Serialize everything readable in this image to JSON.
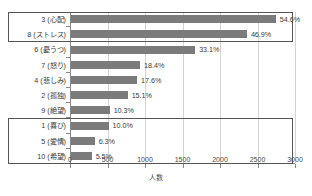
{
  "chart_data": {
    "type": "bar",
    "orientation": "horizontal",
    "title": "",
    "xlabel": "人数",
    "ylabel": "",
    "xlim": [
      0,
      3000
    ],
    "xticks": [
      "0",
      "500",
      "1000",
      "1500",
      "2000",
      "2500",
      "3000"
    ],
    "grid": true,
    "legend": "none",
    "categories": [
      "3 (心配)",
      "8 (ストレス)",
      "6 (憂うつ)",
      "7 (怒り)",
      "4 (悲しみ)",
      "2 (孤独)",
      "9 (絶望)",
      "1 (喜び)",
      "5 (愛情)",
      "10 (希望)"
    ],
    "values": [
      2730,
      2345,
      1655,
      920,
      880,
      755,
      515,
      500,
      315,
      275
    ],
    "data_labels": [
      "54.6%",
      "46.9%",
      "33.1%",
      "18.4%",
      "17.6%",
      "15.1%",
      "10.3%",
      "10.0%",
      "6.3%",
      "5.5%"
    ],
    "annotations": [
      {
        "name": "negative-high-group",
        "rows": [
          0,
          1
        ]
      },
      {
        "name": "positive-low-group",
        "rows": [
          7,
          8,
          9
        ]
      }
    ],
    "bar_color": "#7b7b7b",
    "grid_color": "#d4d4d4",
    "axis_color": "#8a8a8a",
    "highlight_color": "#555555"
  }
}
